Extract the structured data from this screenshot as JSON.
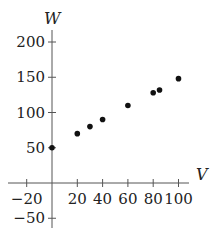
{
  "chart_data": {
    "type": "scatter",
    "title": "",
    "xlabel": "V",
    "ylabel": "W",
    "xlim": [
      -30,
      105
    ],
    "ylim": [
      -65,
      215
    ],
    "grid": false,
    "legend": null,
    "x_ticks": [
      -20,
      20,
      40,
      60,
      80,
      100
    ],
    "x_tick_labels": [
      "−20",
      "20",
      "40",
      "60",
      "80",
      "100"
    ],
    "y_ticks": [
      -50,
      50,
      100,
      150,
      200
    ],
    "y_tick_labels": [
      "−50",
      "50",
      "100",
      "150",
      "200"
    ],
    "series": [
      {
        "name": "data",
        "points": [
          {
            "x": 0,
            "y": 50
          },
          {
            "x": 20,
            "y": 70
          },
          {
            "x": 30,
            "y": 80
          },
          {
            "x": 40,
            "y": 90
          },
          {
            "x": 60,
            "y": 110
          },
          {
            "x": 80,
            "y": 128
          },
          {
            "x": 85,
            "y": 132
          },
          {
            "x": 100,
            "y": 148
          }
        ]
      }
    ]
  },
  "style": {
    "axis_color": "#555555",
    "point_color": "#111111"
  }
}
